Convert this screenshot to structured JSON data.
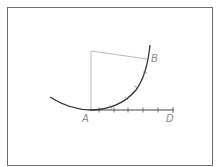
{
  "diagram": {
    "type": "geometric-construction",
    "labels": {
      "A": "A",
      "B": "B",
      "D": "D"
    },
    "points": {
      "A": [
        92,
        110
      ],
      "B": [
        147,
        59
      ],
      "D": [
        174,
        110
      ],
      "C_corner": [
        91,
        51
      ]
    },
    "tangent_line": {
      "from": [
        90,
        110
      ],
      "to": [
        174,
        110
      ],
      "ticks_x": [
        99,
        114,
        128,
        143,
        158,
        173
      ]
    },
    "arc": {
      "description": "curve from left (50,97) through A tangent to line AD, rising to B and beyond (150,45)"
    },
    "construction_lines": [
      {
        "from": [
          91,
          110
        ],
        "to": [
          91,
          51
        ]
      },
      {
        "from": [
          91,
          51
        ],
        "to": [
          147,
          59
        ]
      }
    ],
    "colors": {
      "curve": "#333333",
      "construction": "#a8a8a8",
      "frame": "#6e6e6e",
      "label": "#8a8a8a"
    }
  }
}
